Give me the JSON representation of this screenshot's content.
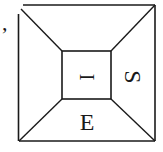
{
  "diagram": {
    "type": "nested-square-frustum",
    "stroke_color": "#1a1a1a",
    "background": "#ffffff",
    "outer_square": {
      "x1": 18,
      "y1": 5,
      "x2": 155,
      "y2": 141
    },
    "inner_square": {
      "x1": 62,
      "y1": 51,
      "x2": 111,
      "y2": 99
    },
    "leading_mark": ",",
    "labels": {
      "inner": "I",
      "right": "S",
      "bottom": "E"
    },
    "label_orientation": {
      "inner": "rotated-90",
      "right": "rotated-90",
      "bottom": "upright"
    }
  }
}
